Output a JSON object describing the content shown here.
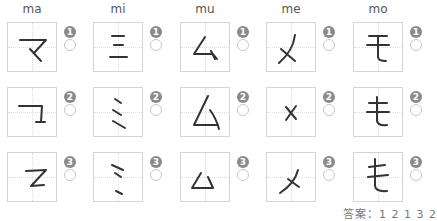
{
  "columns": [
    {
      "romaji": "ma",
      "kana": "マ"
    },
    {
      "romaji": "mi",
      "kana": "ミ"
    },
    {
      "romaji": "mu",
      "kana": "ム"
    },
    {
      "romaji": "me",
      "kana": "メ"
    },
    {
      "romaji": "mo",
      "kana": "モ"
    }
  ],
  "rows": [
    {
      "number": "1"
    },
    {
      "number": "2"
    },
    {
      "number": "3"
    }
  ],
  "answer": {
    "label": "答案：",
    "values": "1 2 1 3 2"
  },
  "colors": {
    "badge": "#8a8a8a",
    "box_border": "#d4d4d4",
    "stroke": "#333333"
  }
}
